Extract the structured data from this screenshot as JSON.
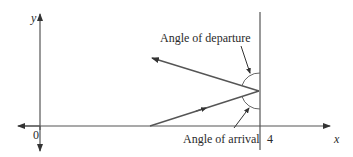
{
  "diagram": {
    "type": "root-locus-angles",
    "axes": {
      "x_label": "x",
      "y_label": "y",
      "origin_label": "0",
      "tick_label": "4"
    },
    "annotations": {
      "departure": "Angle of departure",
      "arrival": "Angle of arrival"
    },
    "colors": {
      "line": "#555555",
      "text": "#2a2a2a",
      "background": "#ffffff"
    }
  }
}
